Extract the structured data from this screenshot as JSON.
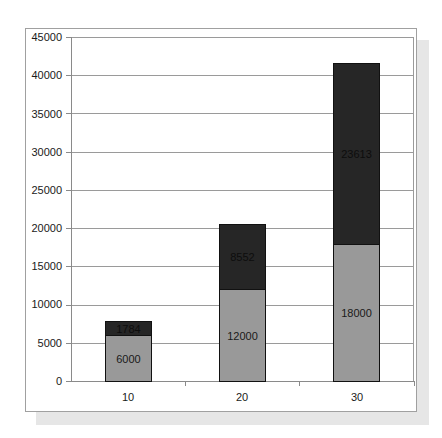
{
  "chart_data": {
    "type": "bar",
    "stacked": true,
    "title": "",
    "xlabel": "",
    "ylabel": "",
    "categories": [
      "10",
      "20",
      "30"
    ],
    "series": [
      {
        "name": "Series 1",
        "color": "#999999",
        "values": [
          6000,
          12000,
          18000
        ]
      },
      {
        "name": "Series 2",
        "color": "#262626",
        "values": [
          1784,
          8552,
          23613
        ]
      }
    ],
    "totals": [
      7784,
      20552,
      41613
    ],
    "ylim": [
      0,
      45000
    ],
    "yticks": [
      "0",
      "5000",
      "10000",
      "15000",
      "20000",
      "25000",
      "30000",
      "35000",
      "40000",
      "45000"
    ],
    "grid": true,
    "legend": null,
    "data_labels": {
      "base": [
        "6000",
        "12000",
        "18000"
      ],
      "top": [
        "1784",
        "8552",
        "23613"
      ]
    }
  }
}
